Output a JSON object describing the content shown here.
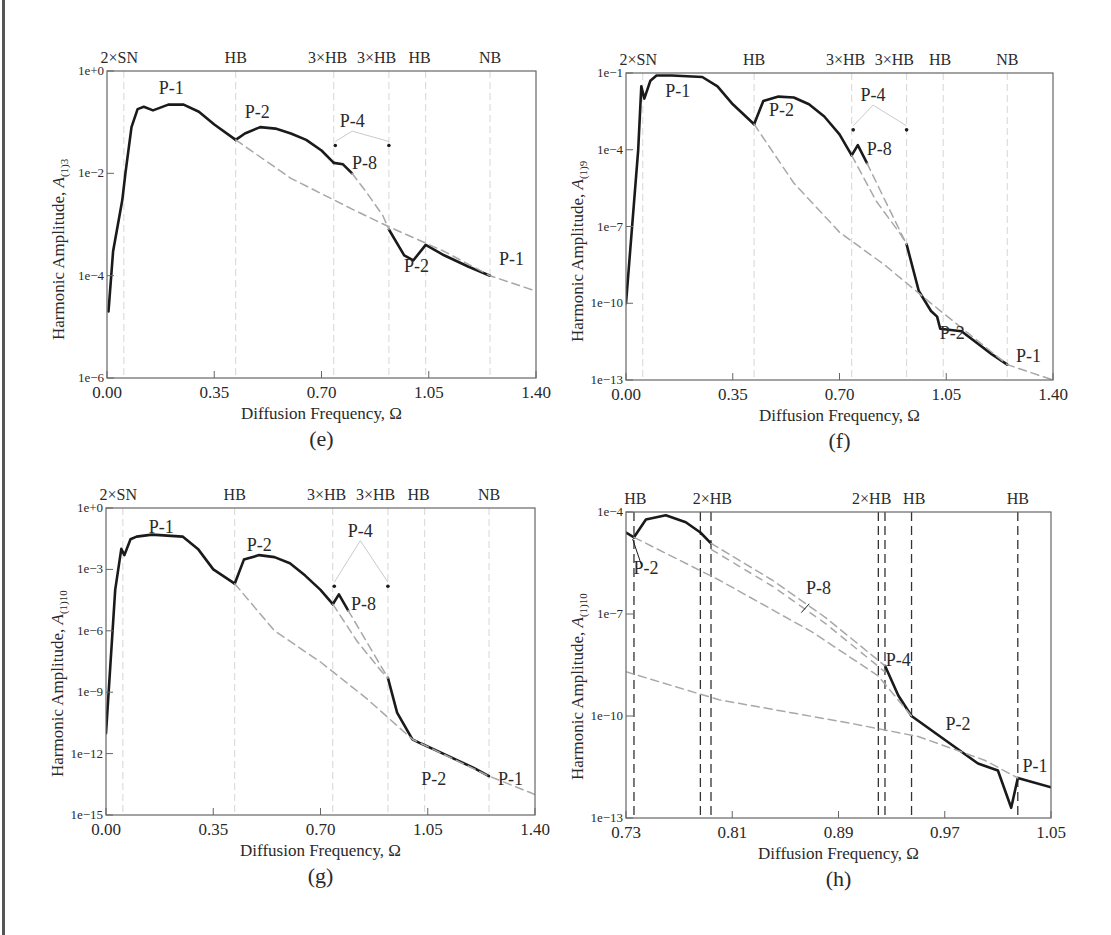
{
  "figure": {
    "xlabel": "Diffusion Frequency, Ω",
    "colors": {
      "solid_curve": "#1a1a1a",
      "dashed_curve": "#a8a8a8",
      "bifurcation_line_light": "#d6d6d6",
      "bifurcation_line_dark": "#333333",
      "frame": "#666666"
    }
  },
  "panels": [
    {
      "id": "e",
      "caption": "(e)",
      "ylabel_main": "Harmonic Amplitude, ",
      "ylabel_sym": "A",
      "ylabel_sub": "(1)3",
      "yticks": [
        "1e+0",
        "1e−2",
        "1e−4",
        "1e−6"
      ],
      "xticks": [
        "0.00",
        "0.35",
        "0.70",
        "1.05",
        "1.40"
      ],
      "top_labels": [
        "2×SN",
        "HB",
        "3×HB",
        "3×HB",
        "HB",
        "NB"
      ],
      "curve_labels": [
        "P-1",
        "P-2",
        "P-4",
        "P-8",
        "P-2",
        "P-1"
      ]
    },
    {
      "id": "f",
      "caption": "(f)",
      "ylabel_main": "Harmonic Amplitude, ",
      "ylabel_sym": "A",
      "ylabel_sub": "(1)9",
      "yticks": [
        "1e−1",
        "1e−4",
        "1e−7",
        "1e−10",
        "1e−13"
      ],
      "xticks": [
        "0.00",
        "0.35",
        "0.70",
        "1.05",
        "1.40"
      ],
      "top_labels": [
        "2×SN",
        "HB",
        "3×HB",
        "3×HB",
        "HB",
        "NB"
      ],
      "curve_labels": [
        "P-1",
        "P-2",
        "P-4",
        "P-8",
        "P-2",
        "P-1"
      ]
    },
    {
      "id": "g",
      "caption": "(g)",
      "ylabel_main": "Harmonic Amplitude, ",
      "ylabel_sym": "A",
      "ylabel_sub": "(1)10",
      "yticks": [
        "1e+0",
        "1e−3",
        "1e−6",
        "1e−9",
        "1e−12",
        "1e−15"
      ],
      "xticks": [
        "0.00",
        "0.35",
        "0.70",
        "1.05",
        "1.40"
      ],
      "top_labels": [
        "2×SN",
        "HB",
        "3×HB",
        "3×HB",
        "HB",
        "NB"
      ],
      "curve_labels": [
        "P-1",
        "P-2",
        "P-4",
        "P-8",
        "P-2",
        "P-1"
      ]
    },
    {
      "id": "h",
      "caption": "(h)",
      "ylabel_main": "Harmonic Amplitude, ",
      "ylabel_sym": "A",
      "ylabel_sub": "(1)10",
      "yticks": [
        "1e−4",
        "1e−7",
        "1e−10",
        "1e−13"
      ],
      "xticks": [
        "0.73",
        "0.81",
        "0.89",
        "0.97",
        "1.05"
      ],
      "top_labels": [
        "HB",
        "2×HB",
        "2×HB",
        "HB",
        "HB"
      ],
      "curve_labels": [
        "P-2",
        "P-8",
        "P-4",
        "P-2",
        "P-1"
      ]
    }
  ],
  "chart_data": [
    {
      "type": "line",
      "panel": "(e)",
      "title": "",
      "xlabel": "Diffusion Frequency, Ω",
      "ylabel": "Harmonic Amplitude, A(1)3",
      "yscale": "log",
      "xlim": [
        0.0,
        1.4
      ],
      "ylim": [
        1e-06,
        1
      ],
      "xticks": [
        0.0,
        0.35,
        0.7,
        1.05,
        1.4
      ],
      "yticks": [
        1,
        0.01,
        0.0001,
        1e-06
      ],
      "bifurcations": [
        {
          "label": "2×SN",
          "x": 0.055
        },
        {
          "label": "HB",
          "x": 0.42
        },
        {
          "label": "3×HB",
          "x": 0.74
        },
        {
          "label": "3×HB",
          "x": 0.92
        },
        {
          "label": "HB",
          "x": 1.04
        },
        {
          "label": "NB",
          "x": 1.25
        }
      ],
      "series": [
        {
          "name": "P-1 (stable)",
          "style": "solid",
          "x": [
            0.005,
            0.02,
            0.05,
            0.06,
            0.08,
            0.1,
            0.12,
            0.15,
            0.2,
            0.25,
            0.3,
            0.35,
            0.42
          ],
          "y": [
            2e-05,
            0.0003,
            0.003,
            0.01,
            0.08,
            0.18,
            0.2,
            0.17,
            0.22,
            0.22,
            0.16,
            0.09,
            0.045
          ]
        },
        {
          "name": "P-2 (stable)",
          "style": "solid",
          "x": [
            0.42,
            0.45,
            0.5,
            0.55,
            0.6,
            0.65,
            0.7,
            0.74
          ],
          "y": [
            0.045,
            0.06,
            0.08,
            0.075,
            0.06,
            0.045,
            0.028,
            0.016
          ]
        },
        {
          "name": "P-4/P-8",
          "style": "solid",
          "x": [
            0.74,
            0.77,
            0.8
          ],
          "y": [
            0.016,
            0.015,
            0.01
          ]
        },
        {
          "name": "P-2 (post)",
          "style": "solid",
          "x": [
            0.92,
            0.97,
            1.0,
            1.04,
            1.1,
            1.18,
            1.25
          ],
          "y": [
            0.0008,
            0.00025,
            0.0002,
            0.0004,
            0.00025,
            0.00015,
            0.0001
          ]
        },
        {
          "name": "P-1 (unstable)",
          "style": "dashed",
          "x": [
            0.42,
            0.6,
            0.8,
            0.92,
            1.1,
            1.25,
            1.4
          ],
          "y": [
            0.045,
            0.008,
            0.002,
            0.0009,
            0.0003,
            0.0001,
            5e-05
          ]
        },
        {
          "name": "P-2 (unstable)",
          "style": "dashed",
          "x": [
            0.8,
            0.85,
            0.9,
            0.92
          ],
          "y": [
            0.01,
            0.004,
            0.0015,
            0.0008
          ]
        }
      ],
      "annotations": [
        "P-1",
        "P-2",
        "P-4",
        "P-8",
        "P-2",
        "P-1"
      ]
    },
    {
      "type": "line",
      "panel": "(f)",
      "xlabel": "Diffusion Frequency, Ω",
      "ylabel": "Harmonic Amplitude, A(1)9",
      "yscale": "log",
      "xlim": [
        0.0,
        1.4
      ],
      "ylim": [
        1e-13,
        0.1
      ],
      "xticks": [
        0.0,
        0.35,
        0.7,
        1.05,
        1.4
      ],
      "yticks": [
        0.1,
        0.0001,
        1e-07,
        1e-10,
        1e-13
      ],
      "bifurcations": [
        {
          "label": "2×SN",
          "x": 0.055
        },
        {
          "label": "HB",
          "x": 0.42
        },
        {
          "label": "3×HB",
          "x": 0.74
        },
        {
          "label": "3×HB",
          "x": 0.92
        },
        {
          "label": "HB",
          "x": 1.04
        },
        {
          "label": "NB",
          "x": 1.25
        }
      ],
      "series": [
        {
          "name": "P-1 (stable)",
          "style": "solid",
          "x": [
            0.0,
            0.04,
            0.05,
            0.06,
            0.08,
            0.1,
            0.15,
            0.25,
            0.3,
            0.35,
            0.42
          ],
          "y": [
            1e-10,
            0.0001,
            0.03,
            0.01,
            0.05,
            0.08,
            0.08,
            0.07,
            0.03,
            0.006,
            0.001
          ]
        },
        {
          "name": "P-2 (stable)",
          "style": "solid",
          "x": [
            0.42,
            0.45,
            0.5,
            0.55,
            0.6,
            0.65,
            0.7,
            0.74
          ],
          "y": [
            0.001,
            0.008,
            0.012,
            0.011,
            0.006,
            0.002,
            0.0004,
            6e-05
          ]
        },
        {
          "name": "P-4/P-8",
          "style": "solid",
          "x": [
            0.74,
            0.76,
            0.79
          ],
          "y": [
            6e-05,
            0.00015,
            3e-05
          ]
        },
        {
          "name": "P-2 (post)",
          "style": "solid",
          "x": [
            0.92,
            0.96,
            1.0,
            1.02,
            1.03,
            1.1,
            1.2,
            1.25
          ],
          "y": [
            2e-08,
            3e-10,
            5e-11,
            3e-11,
            1e-11,
            8e-12,
            1e-12,
            4e-13
          ]
        },
        {
          "name": "P-1 (unstable)",
          "style": "dashed",
          "x": [
            0.42,
            0.55,
            0.7,
            0.85,
            1.0,
            1.25,
            1.4
          ],
          "y": [
            0.001,
            5e-06,
            6e-08,
            3e-09,
            1e-10,
            4e-13,
            1e-13
          ]
        },
        {
          "name": "P-2 (unstable)",
          "style": "dashed",
          "x": [
            0.74,
            0.82,
            0.9,
            0.92
          ],
          "y": [
            6e-05,
            1e-06,
            5e-08,
            2e-08
          ]
        },
        {
          "name": "P-8 (unstable)",
          "style": "dashed",
          "x": [
            0.79,
            0.85,
            0.92
          ],
          "y": [
            3e-05,
            1e-06,
            2e-08
          ]
        }
      ],
      "annotations": [
        "P-1",
        "P-2",
        "P-4",
        "P-8",
        "P-2",
        "P-1"
      ]
    },
    {
      "type": "line",
      "panel": "(g)",
      "xlabel": "Diffusion Frequency, Ω",
      "ylabel": "Harmonic Amplitude, A(1)10",
      "yscale": "log",
      "xlim": [
        0.0,
        1.4
      ],
      "ylim": [
        1e-15,
        1
      ],
      "xticks": [
        0.0,
        0.35,
        0.7,
        1.05,
        1.4
      ],
      "yticks": [
        1,
        0.001,
        1e-06,
        1e-09,
        1e-12,
        1e-15
      ],
      "bifurcations": [
        {
          "label": "2×SN",
          "x": 0.055
        },
        {
          "label": "HB",
          "x": 0.42
        },
        {
          "label": "3×HB",
          "x": 0.74
        },
        {
          "label": "3×HB",
          "x": 0.92
        },
        {
          "label": "HB",
          "x": 1.04
        },
        {
          "label": "NB",
          "x": 1.25
        }
      ],
      "series": [
        {
          "name": "P-1 (stable)",
          "style": "solid",
          "x": [
            0.0,
            0.03,
            0.05,
            0.06,
            0.08,
            0.1,
            0.15,
            0.25,
            0.3,
            0.35,
            0.42
          ],
          "y": [
            1e-11,
            0.0001,
            0.01,
            0.005,
            0.03,
            0.04,
            0.05,
            0.04,
            0.01,
            0.001,
            0.0002
          ]
        },
        {
          "name": "P-2 (stable)",
          "style": "solid",
          "x": [
            0.42,
            0.45,
            0.5,
            0.55,
            0.6,
            0.65,
            0.7,
            0.74
          ],
          "y": [
            0.0002,
            0.003,
            0.005,
            0.004,
            0.002,
            0.0005,
            0.0001,
            2e-05
          ]
        },
        {
          "name": "P-4/P-8",
          "style": "solid",
          "x": [
            0.74,
            0.76,
            0.79
          ],
          "y": [
            2e-05,
            6e-05,
            1e-05
          ]
        },
        {
          "name": "P-2 (post)",
          "style": "solid",
          "x": [
            0.92,
            0.95,
            1.0,
            1.03,
            1.1,
            1.2,
            1.25
          ],
          "y": [
            5e-09,
            1e-10,
            5e-12,
            3e-12,
            1e-12,
            2e-13,
            8e-14
          ]
        },
        {
          "name": "P-1 (unstable)",
          "style": "dashed",
          "x": [
            0.42,
            0.55,
            0.7,
            0.85,
            1.0,
            1.25,
            1.4
          ],
          "y": [
            0.0002,
            1e-06,
            3e-08,
            5e-10,
            5e-12,
            8e-14,
            1e-14
          ]
        },
        {
          "name": "P-2 (unstable)",
          "style": "dashed",
          "x": [
            0.74,
            0.82,
            0.9,
            0.92
          ],
          "y": [
            2e-05,
            3e-07,
            1e-08,
            5e-09
          ]
        },
        {
          "name": "P-8 (unstable)",
          "style": "dashed",
          "x": [
            0.79,
            0.85,
            0.92
          ],
          "y": [
            1e-05,
            3e-07,
            5e-09
          ]
        }
      ],
      "annotations": [
        "P-1",
        "P-2",
        "P-4",
        "P-8",
        "P-2",
        "P-1"
      ]
    },
    {
      "type": "line",
      "panel": "(h)",
      "xlabel": "Diffusion Frequency, Ω",
      "ylabel": "Harmonic Amplitude, A(1)10",
      "yscale": "log",
      "xlim": [
        0.73,
        1.05
      ],
      "ylim": [
        1e-13,
        0.0001
      ],
      "xticks": [
        0.73,
        0.81,
        0.89,
        0.97,
        1.05
      ],
      "yticks": [
        0.0001,
        1e-07,
        1e-10,
        1e-13
      ],
      "bifurcations": [
        {
          "label": "HB",
          "x": 0.736
        },
        {
          "label": "2×HB",
          "x": 0.786
        },
        {
          "label": "2×HB",
          "x": 0.794
        },
        {
          "label": "2×HB",
          "x": 0.92
        },
        {
          "label": "2×HB",
          "x": 0.925
        },
        {
          "label": "HB",
          "x": 0.945
        },
        {
          "label": "HB",
          "x": 1.025
        }
      ],
      "series": [
        {
          "name": "P-1 (stable, left)",
          "style": "solid",
          "x": [
            0.73,
            0.736
          ],
          "y": [
            2.5e-05,
            1.8e-05
          ]
        },
        {
          "name": "P-2 (stable)",
          "style": "solid",
          "x": [
            0.736,
            0.745,
            0.76,
            0.775,
            0.786,
            0.794
          ],
          "y": [
            1.8e-05,
            6e-05,
            8e-05,
            5e-05,
            2.5e-05,
            1.2e-05
          ]
        },
        {
          "name": "P-4 (stable)",
          "style": "solid",
          "x": [
            0.925,
            0.935,
            0.945
          ],
          "y": [
            3e-09,
            4e-10,
            1e-10
          ]
        },
        {
          "name": "P-2 (stable, right)",
          "style": "solid",
          "x": [
            0.945,
            0.97,
            0.995,
            1.01,
            1.02,
            1.025
          ],
          "y": [
            1e-10,
            2e-11,
            4e-12,
            2.5e-12,
            2e-13,
            1.5e-12
          ]
        },
        {
          "name": "P-1 (stable, right)",
          "style": "solid",
          "x": [
            1.025,
            1.05
          ],
          "y": [
            1.5e-12,
            8e-13
          ]
        },
        {
          "name": "P-1 (unstable)",
          "style": "dashed",
          "x": [
            0.73,
            0.8,
            0.9,
            0.95,
            1.0,
            1.025
          ],
          "y": [
            2e-09,
            3e-10,
            6e-11,
            2.5e-11,
            5e-12,
            1.5e-12
          ]
        },
        {
          "name": "P-2 (unstable)",
          "style": "dashed",
          "x": [
            0.736,
            0.8,
            0.87,
            0.92,
            0.945
          ],
          "y": [
            1.8e-05,
            1e-06,
            3e-08,
            1.5e-09,
            1e-10
          ]
        },
        {
          "name": "P-8 (unstable, pair)",
          "style": "dashed",
          "x": [
            0.794,
            0.84,
            0.88,
            0.925
          ],
          "y": [
            1.2e-05,
            1e-06,
            8e-08,
            3e-09
          ]
        }
      ],
      "annotations": [
        "P-2",
        "P-8",
        "P-4",
        "P-2",
        "P-1"
      ]
    }
  ]
}
